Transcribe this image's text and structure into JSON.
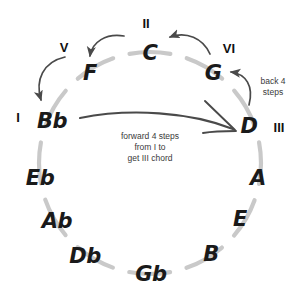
{
  "diagram": {
    "colors": {
      "circle_arc": "#c9c9c9",
      "note_text": "#1a1a1a",
      "numeral_text": "#111111",
      "arrow": "#4a4a4a",
      "annotation_text": "#3a3a3a",
      "background": "#ffffff"
    },
    "notes": [
      {
        "label": "C",
        "x": 150,
        "y": 53,
        "angle_deg": 0
      },
      {
        "label": "G",
        "x": 213,
        "y": 73,
        "angle_deg": 30
      },
      {
        "label": "D",
        "x": 249,
        "y": 126,
        "angle_deg": 60
      },
      {
        "label": "A",
        "x": 258,
        "y": 178,
        "angle_deg": 90
      },
      {
        "label": "E",
        "x": 240,
        "y": 219,
        "angle_deg": 120
      },
      {
        "label": "B",
        "x": 211,
        "y": 254,
        "angle_deg": 150
      },
      {
        "label": "Gb",
        "x": 151,
        "y": 274,
        "angle_deg": 180
      },
      {
        "label": "Db",
        "x": 85,
        "y": 256,
        "angle_deg": 210
      },
      {
        "label": "Ab",
        "x": 57,
        "y": 221,
        "angle_deg": 240
      },
      {
        "label": "Eb",
        "x": 40,
        "y": 178,
        "angle_deg": 270
      },
      {
        "label": "Bb",
        "x": 52,
        "y": 121,
        "angle_deg": 300
      },
      {
        "label": "F",
        "x": 90,
        "y": 73,
        "angle_deg": 330
      }
    ],
    "numerals": [
      {
        "label": "I",
        "x": 18,
        "y": 117,
        "for_note": "Bb"
      },
      {
        "label": "V",
        "x": 64,
        "y": 47,
        "for_note": "F"
      },
      {
        "label": "II",
        "x": 146,
        "y": 23,
        "for_note": "C"
      },
      {
        "label": "VI",
        "x": 229,
        "y": 48,
        "for_note": "G"
      },
      {
        "label": "III",
        "x": 279,
        "y": 127,
        "for_note": "D"
      }
    ],
    "annotations": [
      {
        "name": "back-steps-note",
        "text": "back 4\nsteps",
        "x": 273,
        "y": 87
      },
      {
        "name": "forward-steps-note",
        "text": "forward 4 steps\nfrom I to\nget III chord",
        "x": 150,
        "y": 147
      }
    ],
    "arrows": [
      {
        "name": "arrow-c-to-f",
        "from": "C",
        "to": "F",
        "direction": "counterclockwise"
      },
      {
        "name": "arrow-f-to-bb",
        "from": "F",
        "to": "Bb",
        "direction": "counterclockwise"
      },
      {
        "name": "arrow-g-to-c",
        "from": "G",
        "to": "C",
        "direction": "counterclockwise"
      },
      {
        "name": "arrow-d-to-g",
        "from": "D",
        "to": "G",
        "direction": "counterclockwise"
      },
      {
        "name": "arrow-bb-to-d",
        "from": "Bb",
        "to": "D",
        "direction": "forward-chord"
      }
    ]
  }
}
